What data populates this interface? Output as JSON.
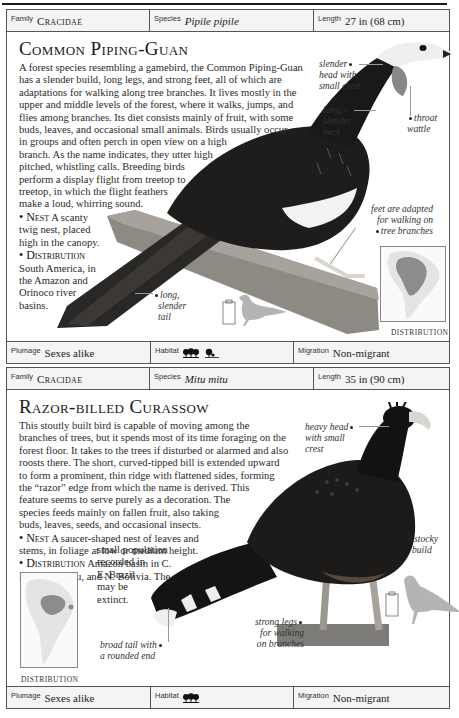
{
  "entries": [
    {
      "family_label": "Family",
      "family": "Cracidae",
      "species_label": "Species",
      "species": "Pipile pipile",
      "length_label": "Length",
      "length": "27 in (68 cm)",
      "title": "Common Piping-Guan",
      "body_lines": [
        "A forest species resembling a gamebird, the Common Piping-Guan",
        "has a slender build, long legs, and strong feet, all of which are",
        "adaptations for walking along tree branches. It lives mostly in the",
        "upper and middle levels of the forest, where it walks, jumps, and",
        "flies among branches. Its diet consists mainly of fruit, with some",
        "buds, leaves, and occasional small animals. Birds usually occur",
        "in groups and often perch in open view on a high",
        "branch. As the name indicates, they utter high",
        "pitched, whistling calls. Breeding birds",
        "perform a display flight from treetop to",
        "treetop, in which the flight feathers",
        "make a loud, whirring sound."
      ],
      "nest_head": "• Nest",
      "nest_lines": [
        " A scanty",
        "twig nest, placed",
        "high in the canopy."
      ],
      "dist_head": "• Distribution",
      "dist_lines": [
        "South America, in",
        "the Amazon and",
        "Orinoco river",
        "basins."
      ],
      "callouts": {
        "head": [
          "slender",
          "head with",
          "small crest"
        ],
        "neck": [
          "long,",
          "slender",
          "neck"
        ],
        "wattle": [
          "throat",
          "wattle"
        ],
        "feet": [
          "feet are adapted",
          "for walking on",
          "tree branches"
        ],
        "tail": [
          "long,",
          "slender",
          "tail"
        ]
      },
      "distribution_label": "DISTRIBUTION",
      "plumage_label": "Plumage",
      "plumage": "Sexes alike",
      "habitat_label": "Habitat",
      "habitat_icons": [
        "forest-icon",
        "mangrove-icon"
      ],
      "migration_label": "Migration",
      "migration": "Non-migrant"
    },
    {
      "family_label": "Family",
      "family": "Cracidae",
      "species_label": "Species",
      "species": "Mitu mitu",
      "length_label": "Length",
      "length": "35 in (90 cm)",
      "title": "Razor-billed Curassow",
      "body_lines": [
        "This stoutly built bird is capable of moving among the",
        "branches of trees, but it spends most of its time foraging on the",
        "forest floor. It takes to the trees if disturbed or alarmed and also",
        "roosts there. The short, curved-tipped bill is extended upward",
        "to form a prominent, thin ridge with flattened sides, forming",
        "the “razor” edge from which the name is derived. This",
        "feature seems to serve purely as a decoration. The",
        "species feeds mainly on fallen fruit, also taking",
        "buds, leaves, seeds, and occasional insects."
      ],
      "nest_head": "• Nest",
      "nest_lines": [
        " A saucer-shaped nest of leaves and",
        "stems, in foliage at low or medium height."
      ],
      "dist_head": "• Distribution",
      "dist_lines": [
        " Amazon basin in C.",
        "Brazil, E. Peru, and N. Bolivia. The"
      ],
      "dist_extra_lines": [
        "small population",
        "recorded in",
        "E. Brazil",
        "may be",
        "extinct."
      ],
      "callouts": {
        "head": [
          "heavy head",
          "with small",
          "crest"
        ],
        "build": [
          "stocky",
          "build"
        ],
        "legs": [
          "strong legs",
          "for walking",
          "on branches"
        ],
        "tail": [
          "broad tail with",
          "a rounded end"
        ]
      },
      "distribution_label": "DISTRIBUTION",
      "plumage_label": "Plumage",
      "plumage": "Sexes alike",
      "habitat_label": "Habitat",
      "habitat_icons": [
        "forest-icon"
      ],
      "migration_label": "Migration",
      "migration": "Non-migrant"
    }
  ],
  "colors": {
    "border": "#555555",
    "infobar_bg": "#f4f4f4",
    "map_land": "#e6e6e6",
    "map_range": "#8c8c8c",
    "silhouette": "#b4b4b4"
  }
}
